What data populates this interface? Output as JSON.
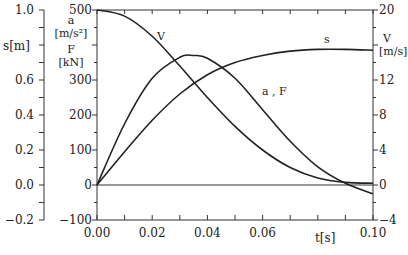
{
  "chart_data": {
    "type": "line",
    "title": "",
    "xlabel": "t[s]",
    "xlim": [
      0.0,
      0.1
    ],
    "x_ticks": [
      "0.00",
      "0.02",
      "0.04",
      "0.06",
      "0.10"
    ],
    "axes": {
      "left_outer": {
        "label": "s[m]",
        "ylim": [
          -0.2,
          1.0
        ],
        "ticks": [
          "1.0",
          "0.6",
          "0.4",
          "0.2",
          "0.0",
          "-0.2"
        ]
      },
      "left_inner": {
        "label_lines": [
          "a",
          "[m/s²]",
          "F",
          "[kN]"
        ],
        "ylim": [
          -100,
          500
        ],
        "ticks": [
          "500",
          "300",
          "200",
          "100",
          "0",
          "-100"
        ]
      },
      "right": {
        "label_lines": [
          "V",
          "[m/s]"
        ],
        "ylim": [
          -4,
          20
        ],
        "ticks": [
          "20",
          "12",
          "8",
          "4",
          "0",
          "-4"
        ]
      }
    },
    "grid": false,
    "legend": "inline curve labels",
    "series": [
      {
        "name": "V",
        "label": "V",
        "axis": "right",
        "x": [
          0.0,
          0.01,
          0.02,
          0.03,
          0.04,
          0.05,
          0.06,
          0.07,
          0.08,
          0.09,
          0.1
        ],
        "values": [
          20.0,
          19.3,
          17.0,
          13.6,
          10.0,
          6.7,
          4.0,
          2.0,
          0.8,
          0.3,
          0.2
        ]
      },
      {
        "name": "a, F",
        "label": "a , F",
        "axis": "left_inner",
        "x": [
          0.0,
          0.01,
          0.02,
          0.03,
          0.035,
          0.04,
          0.05,
          0.06,
          0.07,
          0.08,
          0.09,
          0.1
        ],
        "values": [
          0,
          175,
          305,
          365,
          370,
          362,
          305,
          215,
          125,
          52,
          5,
          -25
        ]
      },
      {
        "name": "s",
        "label": "s",
        "axis": "left_outer",
        "x": [
          0.0,
          0.01,
          0.02,
          0.03,
          0.04,
          0.05,
          0.06,
          0.07,
          0.08,
          0.09,
          0.1
        ],
        "values": [
          0.0,
          0.19,
          0.37,
          0.52,
          0.63,
          0.7,
          0.74,
          0.765,
          0.775,
          0.775,
          0.77
        ]
      }
    ]
  }
}
